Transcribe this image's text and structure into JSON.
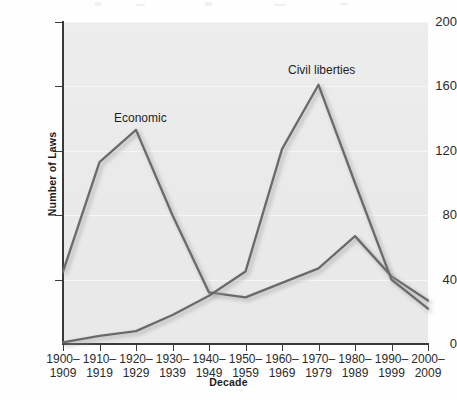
{
  "chart_data": {
    "type": "line",
    "title": "",
    "xlabel": "Decade",
    "ylabel": "Number of Laws",
    "categories": [
      "1900–1909",
      "1910–1919",
      "1920–1929",
      "1930–1939",
      "1940–1949",
      "1950–1959",
      "1960–1969",
      "1970–1979",
      "1980–1989",
      "1990–1999",
      "2000–2009"
    ],
    "category_lines": [
      [
        "1900–",
        "1909"
      ],
      [
        "1910–",
        "1919"
      ],
      [
        "1920–",
        "1929"
      ],
      [
        "1930–",
        "1939"
      ],
      [
        "1940–",
        "1949"
      ],
      [
        "1950–",
        "1959"
      ],
      [
        "1960–",
        "1969"
      ],
      [
        "1970–",
        "1979"
      ],
      [
        "1980–",
        "1989"
      ],
      [
        "1990–",
        "1999"
      ],
      [
        "2000–",
        "2009"
      ]
    ],
    "series": [
      {
        "name": "Economic",
        "color": "#6b6b6b",
        "values": [
          45,
          113,
          133,
          80,
          32,
          29,
          38,
          47,
          67,
          42,
          27
        ]
      },
      {
        "name": "Civil liberties",
        "color": "#6b6b6b",
        "values": [
          1,
          5,
          8,
          18,
          30,
          45,
          121,
          161,
          100,
          40,
          22
        ]
      }
    ],
    "ylim": [
      0,
      200
    ],
    "yticks": [
      0,
      40,
      80,
      120,
      160,
      200
    ],
    "ytick_labels": [
      "0",
      "40",
      "80",
      "120",
      "160",
      "200"
    ],
    "grid": true,
    "grid_axis": "y",
    "legend_position": "inline-annotations",
    "annotations": [
      {
        "text": "Economic",
        "series": "Economic"
      },
      {
        "text": "Civil liberties",
        "series": "Civil liberties"
      }
    ],
    "plot_background_color": "#ebebeb",
    "axis_color": "#3a3a3a",
    "gridline_color": "#f6f6f6"
  },
  "axes": {
    "y_title": "Number of Laws",
    "x_title": "Decade"
  }
}
